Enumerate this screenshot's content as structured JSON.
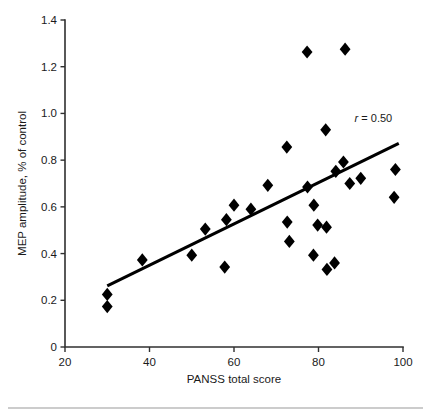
{
  "chart_data": {
    "type": "scatter",
    "title": "",
    "xlabel": "PANSS total score",
    "ylabel": "MEP amplitude, % of control",
    "xlim": [
      20,
      100
    ],
    "ylim": [
      0,
      1.4
    ],
    "xticks": [
      20,
      40,
      60,
      80,
      100
    ],
    "yticks": [
      0,
      0.2,
      0.4,
      0.6,
      0.8,
      1.0,
      1.2,
      1.4
    ],
    "xtick_labels": [
      "20",
      "40",
      "60",
      "80",
      "100"
    ],
    "ytick_labels": [
      "0",
      "0.2",
      "0.4",
      "0.6",
      "0.8",
      "1.0",
      "1.2",
      "1.4"
    ],
    "grid": false,
    "legend": null,
    "marker": "diamond",
    "marker_color": "#000000",
    "points": [
      {
        "x": 30.0,
        "y": 0.225
      },
      {
        "x": 30.0,
        "y": 0.173
      },
      {
        "x": 38.3,
        "y": 0.373
      },
      {
        "x": 50.0,
        "y": 0.393
      },
      {
        "x": 53.2,
        "y": 0.505
      },
      {
        "x": 57.8,
        "y": 0.342
      },
      {
        "x": 58.2,
        "y": 0.545
      },
      {
        "x": 60.0,
        "y": 0.607
      },
      {
        "x": 64.0,
        "y": 0.59
      },
      {
        "x": 68.0,
        "y": 0.692
      },
      {
        "x": 72.5,
        "y": 0.856
      },
      {
        "x": 72.6,
        "y": 0.535
      },
      {
        "x": 73.1,
        "y": 0.452
      },
      {
        "x": 77.3,
        "y": 1.263
      },
      {
        "x": 77.4,
        "y": 0.685
      },
      {
        "x": 78.9,
        "y": 0.607
      },
      {
        "x": 78.8,
        "y": 0.393
      },
      {
        "x": 79.8,
        "y": 0.522
      },
      {
        "x": 81.7,
        "y": 0.93
      },
      {
        "x": 81.9,
        "y": 0.513
      },
      {
        "x": 82.0,
        "y": 0.332
      },
      {
        "x": 83.8,
        "y": 0.36
      },
      {
        "x": 84.1,
        "y": 0.752
      },
      {
        "x": 85.9,
        "y": 0.792
      },
      {
        "x": 86.3,
        "y": 1.275
      },
      {
        "x": 87.4,
        "y": 0.7
      },
      {
        "x": 90.0,
        "y": 0.722
      },
      {
        "x": 98.2,
        "y": 0.76
      },
      {
        "x": 97.9,
        "y": 0.641
      }
    ],
    "trend_line": {
      "x_start": 30.0,
      "y_start": 0.262,
      "x_end": 99.0,
      "y_end": 0.872
    },
    "annotations": [
      {
        "name": "correlation",
        "italic_part": "r",
        "rest": " = 0.50",
        "full_text": "r = 0.50",
        "x": 93.0,
        "y": 0.965
      }
    ]
  }
}
